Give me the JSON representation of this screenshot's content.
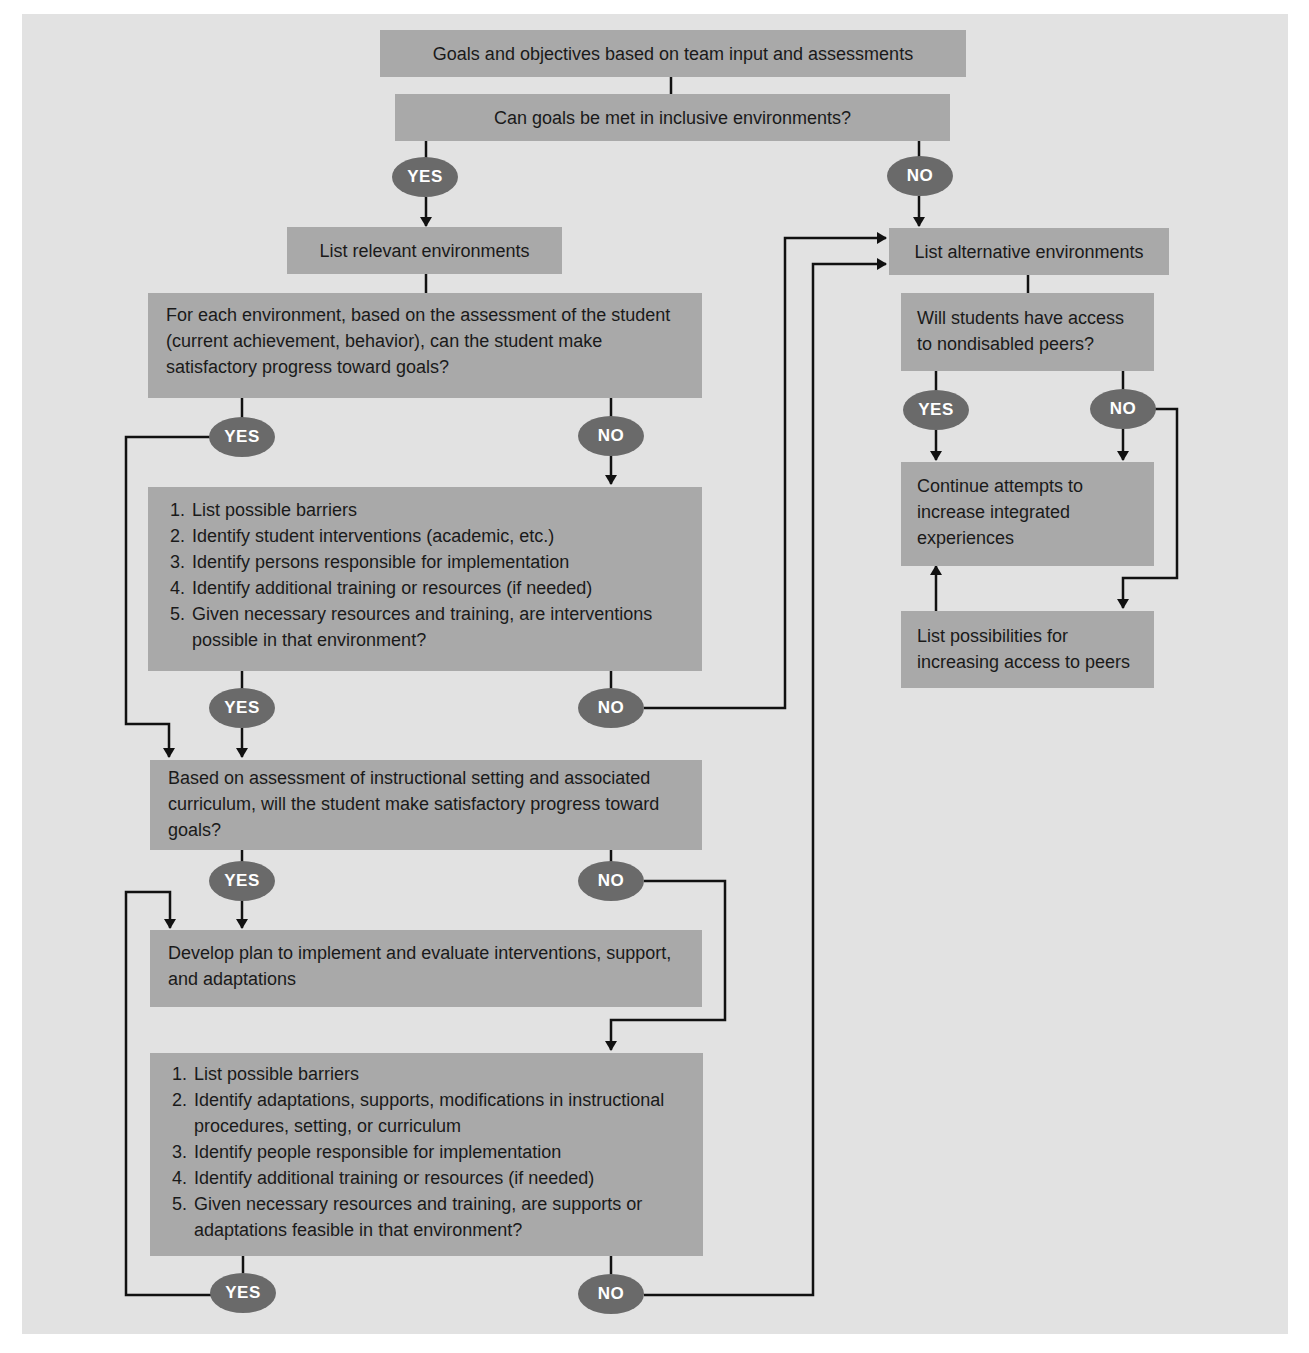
{
  "diagram": {
    "nodes": {
      "goals": {
        "text": "Goals and objectives based on team input and assessments"
      },
      "inclusive_question": {
        "text": "Can goals be met in inclusive environments?"
      },
      "relevant_envs": {
        "text": "List relevant environments"
      },
      "each_env_question": {
        "text": "For each environment, based on the assessment of the student (current achievement, behavior), can the student make satisfactory progress toward goals?"
      },
      "interventions_list": {
        "items": [
          "List possible barriers",
          "Identify student interventions (academic, etc.)",
          "Identify persons responsible for implementation",
          "Identify additional training or resources (if needed)",
          "Given necessary resources and training, are interventions possible in that environment?"
        ]
      },
      "instructional_question": {
        "text": "Based on assessment of instructional setting and associated curriculum, will the student make satisfactory progress toward goals?"
      },
      "develop_plan": {
        "text": "Develop plan to implement and evaluate interventions, support, and adaptations"
      },
      "adaptations_list": {
        "items": [
          "List possible barriers",
          "Identify adaptations, supports, modifications in instructional procedures, setting, or curriculum",
          "Identify people responsible for implementation",
          "Identify additional training or resources (if needed)",
          "Given necessary resources and training, are supports or adaptations feasible in that environment?"
        ]
      },
      "alternative_envs": {
        "text": "List alternative environments"
      },
      "peers_question": {
        "text": "Will students have access to nondisabled peers?"
      },
      "continue_attempts": {
        "text": "Continue attempts to increase integrated experiences"
      },
      "increase_access": {
        "text": "List possibilities for increasing access to peers"
      }
    },
    "decisions": {
      "yes": "YES",
      "no": "NO"
    },
    "colors": {
      "page": "#ffffff",
      "panel": "#e2e2e2",
      "box": "#a9a9a9",
      "oval": "#6a6a6a",
      "oval_text": "#ffffff",
      "line": "#111111"
    }
  }
}
